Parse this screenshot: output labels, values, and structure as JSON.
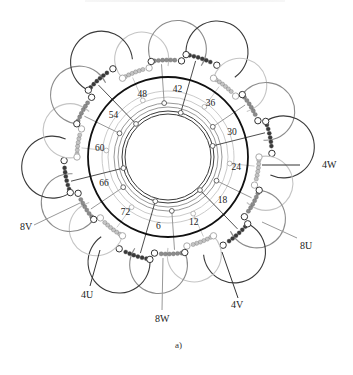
{
  "figure": {
    "caption": "a)",
    "center": [
      168,
      157
    ],
    "main_ring_radius": 80,
    "colors": {
      "phase_dark": "#3a3a3a",
      "phase_mid": "#8c8c8c",
      "phase_light": "#c4c4c4",
      "ring": "#111111"
    },
    "slot_labels": [
      "6",
      "12",
      "18",
      "24",
      "30",
      "36",
      "42",
      "48",
      "54",
      "60",
      "66",
      "72"
    ],
    "slot_label_angle_ref": {
      "slot": 42,
      "angle_deg": -82,
      "deg_per_slot": 5
    },
    "terminal_labels": [
      {
        "text": "4W",
        "x": 322,
        "y": 160
      },
      {
        "text": "8U",
        "x": 300,
        "y": 241
      },
      {
        "text": "4V",
        "x": 231,
        "y": 300
      },
      {
        "text": "8W",
        "x": 155,
        "y": 314
      },
      {
        "text": "4U",
        "x": 81,
        "y": 290
      },
      {
        "text": "8V",
        "x": 20,
        "y": 222
      }
    ],
    "coil_groups": 6,
    "phases": [
      "U",
      "V",
      "W"
    ]
  }
}
